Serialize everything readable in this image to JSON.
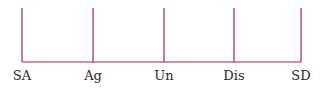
{
  "scale": {
    "line_color": "#a3254a",
    "points": [
      {
        "label": "SA",
        "x": 22
      },
      {
        "label": "Ag",
        "x": 93
      },
      {
        "label": "Un",
        "x": 164
      },
      {
        "label": "Dis",
        "x": 234
      },
      {
        "label": "SD",
        "x": 301
      }
    ]
  }
}
